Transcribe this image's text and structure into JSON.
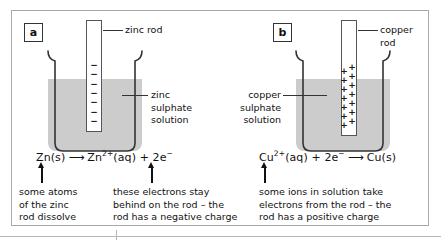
{
  "figure": {
    "panels": [
      {
        "id": "a",
        "label": "a",
        "rod_label": "zinc rod",
        "solution_label": "zinc\nsulphate\nsolution",
        "charge_symbols": "−",
        "charge_count": 7,
        "charge_sign": "negative",
        "equation": {
          "reactant": "Zn(s)",
          "arrow": "⟶",
          "product_ion": "Zn",
          "product_ion_charge": "2+",
          "product_state": "(aq)",
          "plus": "+",
          "electrons": "2e",
          "electron_charge": "−"
        },
        "annotations": [
          "some atoms\nof the zinc\nrod dissolve",
          "these electrons stay\nbehind on the rod – the\nrod has a negative charge"
        ]
      },
      {
        "id": "b",
        "label": "b",
        "rod_label": "copper\nrod",
        "solution_label": "copper\nsulphate\nsolution",
        "charge_symbols": "+",
        "charge_count": 7,
        "charge_sign": "positive",
        "equation": {
          "reactant_ion": "Cu",
          "reactant_ion_charge": "2+",
          "reactant_state": "(aq)",
          "plus": "+",
          "electrons": "2e",
          "electron_charge": "−",
          "arrow": "⟶",
          "product": "Cu(s)"
        },
        "annotations": [
          "some ions in solution take\nelectrons from the rod – the\nrod has a positive charge"
        ]
      }
    ],
    "colors": {
      "solution_fill": "#cccccc",
      "beaker_outline": "#333333",
      "frame_border": "#a9a9a9",
      "text": "#111111"
    }
  }
}
